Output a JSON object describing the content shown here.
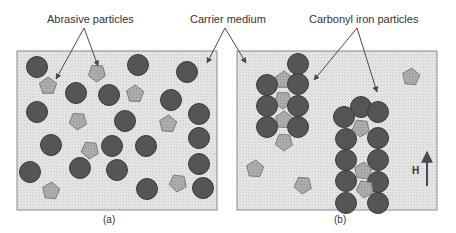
{
  "labels": {
    "abrasive": "Abrasive particles",
    "carrier": "Carrier medium",
    "carbonyl": "Carbonyl iron particles",
    "panel_a": "(a)",
    "panel_b": "(b)",
    "field": "H"
  },
  "colors": {
    "medium": "#e4e4e4",
    "border": "#8a8a8a",
    "iron": "#555555",
    "iron_stroke": "#3a3a3a",
    "abrasive": "#a9a9a9",
    "abrasive_stroke": "#7c7c7c",
    "arrow": "#4a4a4a"
  },
  "panel_a": {
    "iron": [
      [
        37,
        67
      ],
      [
        138,
        65
      ],
      [
        187,
        72
      ],
      [
        76,
        93
      ],
      [
        109,
        95
      ],
      [
        171,
        100
      ],
      [
        37,
        112
      ],
      [
        125,
        121
      ],
      [
        199,
        114
      ],
      [
        51,
        145
      ],
      [
        112,
        146
      ],
      [
        146,
        146
      ],
      [
        199,
        138
      ],
      [
        30,
        172
      ],
      [
        80,
        168
      ],
      [
        117,
        170
      ],
      [
        147,
        189
      ],
      [
        199,
        164
      ],
      [
        203,
        188
      ]
    ],
    "abrasive": [
      [
        48,
        86
      ],
      [
        97,
        73
      ],
      [
        135,
        94
      ],
      [
        78,
        121
      ],
      [
        168,
        124
      ],
      [
        90,
        150
      ],
      [
        51,
        191
      ],
      [
        178,
        183
      ]
    ]
  },
  "panel_b": {
    "iron": [
      [
        267,
        85
      ],
      [
        267,
        106
      ],
      [
        267,
        127
      ],
      [
        298,
        64
      ],
      [
        298,
        84
      ],
      [
        298,
        106
      ],
      [
        298,
        127
      ],
      [
        361,
        107
      ],
      [
        344,
        117
      ],
      [
        378,
        112
      ],
      [
        346,
        139
      ],
      [
        378,
        138
      ],
      [
        346,
        160
      ],
      [
        378,
        160
      ],
      [
        346,
        181
      ],
      [
        378,
        182
      ],
      [
        346,
        203
      ],
      [
        378,
        203
      ]
    ],
    "abrasive": [
      [
        284,
        80
      ],
      [
        283,
        100
      ],
      [
        284,
        120
      ],
      [
        284,
        142
      ],
      [
        255,
        169
      ],
      [
        303,
        185
      ],
      [
        411,
        77
      ],
      [
        361,
        128
      ],
      [
        363,
        171
      ],
      [
        365,
        189
      ]
    ]
  }
}
